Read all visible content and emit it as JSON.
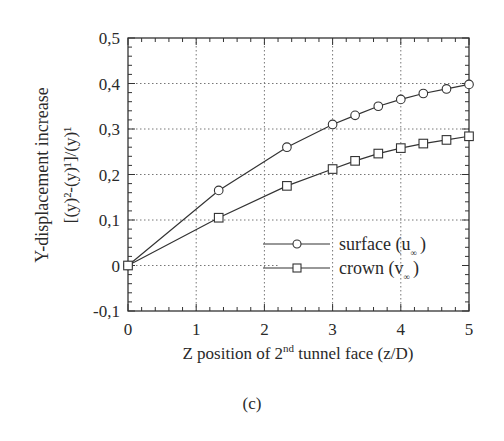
{
  "chart_data": {
    "type": "line",
    "title": "",
    "xlabel": "Z position of 2nd tunnel face (z/D)",
    "xlabel_parts": {
      "pre": "Z position of 2",
      "sup": "nd",
      "post": " tunnel face (z/D)"
    },
    "ylabel": "Y-displacement increase [(y)^2-(y)^1]/(y)^1",
    "ylabel_line1": "Y-displacement increase",
    "ylabel_line2": "[(y)²-(y)¹]/(y)¹",
    "xlim": [
      0,
      5
    ],
    "ylim": [
      -0.1,
      0.5
    ],
    "xticks": [
      "0",
      "1",
      "2",
      "3",
      "4",
      "5"
    ],
    "yticks": [
      "-0,1",
      "0",
      "0,1",
      "0,2",
      "0,3",
      "0,4",
      "0,5"
    ],
    "grid": true,
    "legend_position": "lower right",
    "series": [
      {
        "name": "surface (u∞)",
        "label_main": "surface (u",
        "label_sub": "∞",
        "label_end": ")",
        "marker": "circle",
        "x": [
          0,
          1.33,
          2.33,
          3.0,
          3.33,
          3.67,
          4.0,
          4.33,
          4.67,
          5.0
        ],
        "y": [
          0,
          0.165,
          0.26,
          0.31,
          0.33,
          0.35,
          0.365,
          0.378,
          0.388,
          0.398
        ]
      },
      {
        "name": "crown (v∞)",
        "label_main": "crown (v",
        "label_sub": "∞",
        "label_end": ")",
        "marker": "square",
        "x": [
          0,
          1.33,
          2.33,
          3.0,
          3.33,
          3.67,
          4.0,
          4.33,
          4.67,
          5.0
        ],
        "y": [
          0,
          0.105,
          0.175,
          0.212,
          0.23,
          0.246,
          0.258,
          0.268,
          0.276,
          0.284
        ]
      }
    ]
  },
  "caption": "(c)"
}
